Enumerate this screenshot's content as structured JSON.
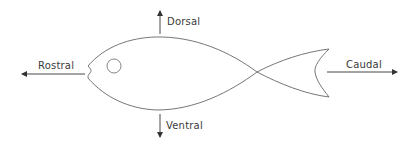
{
  "diagram": {
    "labels": {
      "dorsal": "Dorsal",
      "ventral": "Ventral",
      "rostral": "Rostral",
      "caudal": "Caudal"
    },
    "colors": {
      "stroke": "#555555",
      "arrow": "#333333",
      "text": "#3a3a3a",
      "background": "#ffffff"
    }
  }
}
